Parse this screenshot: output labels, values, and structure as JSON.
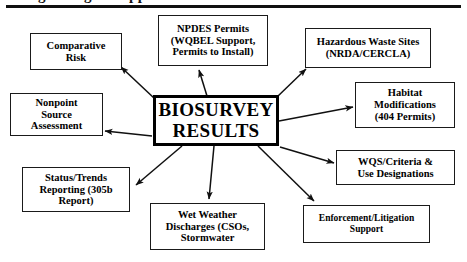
{
  "header": {
    "clipped_title": "Using Biological Approaches",
    "rule": "horizontal-rule"
  },
  "diagram": {
    "type": "hub-and-spoke",
    "center": {
      "id": "biosurvey-results",
      "label": "BIOSURVEY RESULTS",
      "line1": "BIOSURVEY",
      "line2": "RESULTS"
    },
    "nodes": [
      {
        "id": "comparative-risk",
        "label": "Comparative Risk",
        "lines": [
          "Comparative",
          "Risk"
        ]
      },
      {
        "id": "npdes-permits",
        "label": "NPDES Permits (WQBEL Support, Permits to Install)",
        "lines": [
          "NPDES Permits",
          "(WQBEL Support,",
          "Permits to Install)"
        ]
      },
      {
        "id": "hazardous-waste-sites",
        "label": "Hazardous Waste Sites (NRDA/CERCLA)",
        "lines": [
          "Hazardous Waste Sites",
          "(NRDA/CERCLA)"
        ]
      },
      {
        "id": "habitat-modifications",
        "label": "Habitat Modifications (404 Permits)",
        "lines": [
          "Habitat",
          "Modifications",
          "(404 Permits)"
        ]
      },
      {
        "id": "nonpoint-source-assessment",
        "label": "Nonpoint Source Assessment",
        "lines": [
          "Nonpoint",
          "Source",
          "Assessment"
        ]
      },
      {
        "id": "wqs-criteria-use-designations",
        "label": "WQS/Criteria & Use Designations",
        "lines": [
          "WQS/Criteria &",
          "Use Designations"
        ]
      },
      {
        "id": "status-trends-reporting",
        "label": "Status/Trends Reporting (305b Report)",
        "lines": [
          "Status/Trends",
          "Reporting (305b",
          "Report)"
        ]
      },
      {
        "id": "wet-weather-discharges",
        "label": "Wet Weather Discharges (CSOs, Stormwater",
        "lines": [
          "Wet Weather",
          "Discharges (CSOs,",
          "Stormwater"
        ]
      },
      {
        "id": "enforcement-litigation-support",
        "label": "Enforcement/Litigation Support",
        "lines": [
          "Enforcement/Litigation",
          "Support"
        ]
      }
    ],
    "arrows": [
      {
        "from": "biosurvey-results",
        "to": "comparative-risk"
      },
      {
        "from": "biosurvey-results",
        "to": "npdes-permits"
      },
      {
        "from": "biosurvey-results",
        "to": "hazardous-waste-sites"
      },
      {
        "from": "biosurvey-results",
        "to": "habitat-modifications"
      },
      {
        "from": "biosurvey-results",
        "to": "nonpoint-source-assessment"
      },
      {
        "from": "biosurvey-results",
        "to": "wqs-criteria-use-designations"
      },
      {
        "from": "biosurvey-results",
        "to": "status-trends-reporting"
      },
      {
        "from": "biosurvey-results",
        "to": "wet-weather-discharges"
      },
      {
        "from": "biosurvey-results",
        "to": "enforcement-litigation-support"
      }
    ],
    "colors": {
      "ink": "#000000",
      "box_border": "#1a1a1a",
      "background": "#ffffff"
    }
  }
}
